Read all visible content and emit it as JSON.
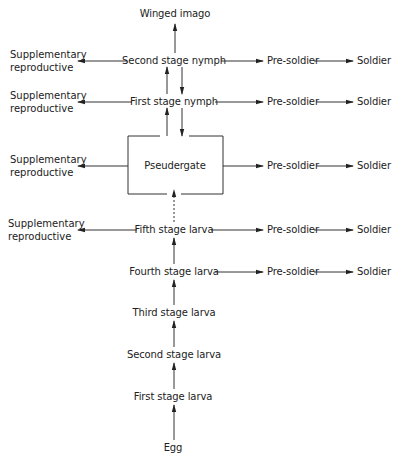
{
  "diagram": {
    "type": "flowchart",
    "title": "",
    "nodes": {
      "winged_imago": "Winged imago",
      "second_stage_nymph": "Second stage nymph",
      "first_stage_nymph": "First stage nymph",
      "pseudergate": "Pseudergate",
      "fifth_stage_larva": "Fifth stage larva",
      "fourth_stage_larva": "Fourth stage larva",
      "third_stage_larva": "Third stage larva",
      "second_stage_larva": "Second stage larva",
      "first_stage_larva": "First stage larva",
      "egg": "Egg"
    },
    "supplementary": {
      "line1": "Supplementary",
      "line2": "reproductive"
    },
    "pre_soldier": "Pre-soldier",
    "soldier": "Soldier",
    "edges": [
      {
        "from": "Egg",
        "to": "First stage larva",
        "style": "solid"
      },
      {
        "from": "First stage larva",
        "to": "Second stage larva",
        "style": "solid"
      },
      {
        "from": "Second stage larva",
        "to": "Third stage larva",
        "style": "solid"
      },
      {
        "from": "Third stage larva",
        "to": "Fourth stage larva",
        "style": "solid"
      },
      {
        "from": "Fourth stage larva",
        "to": "Fifth stage larva",
        "style": "solid"
      },
      {
        "from": "Fifth stage larva",
        "to": "Pseudergate",
        "style": "dashed"
      },
      {
        "from": "Pseudergate",
        "to": "First stage nymph",
        "style": "solid"
      },
      {
        "from": "First stage nymph",
        "to": "Pseudergate",
        "style": "solid"
      },
      {
        "from": "First stage nymph",
        "to": "Second stage nymph",
        "style": "solid"
      },
      {
        "from": "Second stage nymph",
        "to": "First stage nymph",
        "style": "solid"
      },
      {
        "from": "Second stage nymph",
        "to": "Winged imago",
        "style": "solid"
      },
      {
        "from": "Second stage nymph",
        "to": "Supplementary reproductive",
        "style": "solid"
      },
      {
        "from": "First stage nymph",
        "to": "Supplementary reproductive",
        "style": "solid"
      },
      {
        "from": "Pseudergate",
        "to": "Supplementary reproductive",
        "style": "solid"
      },
      {
        "from": "Fifth stage larva",
        "to": "Supplementary reproductive",
        "style": "solid"
      },
      {
        "from": "Second stage nymph",
        "to": "Pre-soldier",
        "style": "solid"
      },
      {
        "from": "First stage nymph",
        "to": "Pre-soldier",
        "style": "solid"
      },
      {
        "from": "Pseudergate",
        "to": "Pre-soldier",
        "style": "solid"
      },
      {
        "from": "Fifth stage larva",
        "to": "Pre-soldier",
        "style": "solid"
      },
      {
        "from": "Fourth stage larva",
        "to": "Pre-soldier",
        "style": "solid"
      },
      {
        "from": "Pre-soldier",
        "to": "Soldier",
        "style": "solid"
      }
    ]
  }
}
